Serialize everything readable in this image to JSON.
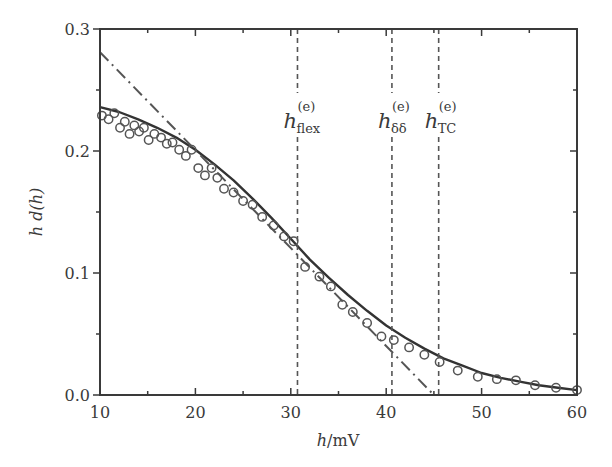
{
  "chart_data": {
    "type": "scatter",
    "title": "",
    "xlabel": "h/mV",
    "ylabel": "h d(h)",
    "xlim": [
      10,
      60
    ],
    "ylim": [
      0.0,
      0.3
    ],
    "x_ticks": [
      10,
      20,
      30,
      40,
      50,
      60
    ],
    "x_tick_labels": [
      "10",
      "20",
      "30",
      "40",
      "50",
      "60"
    ],
    "y_ticks": [
      0.0,
      0.1,
      0.2,
      0.3
    ],
    "y_tick_labels": [
      "0.0",
      "0.1",
      "0.2",
      "0.3"
    ],
    "x_minor_step": 5,
    "y_minor_step": 0.05,
    "grid": false,
    "legend": null,
    "series": [
      {
        "name": "data (circles)",
        "kind": "scatter",
        "marker": "open-circle",
        "color": "#555555",
        "x": [
          10.2,
          10.9,
          11.5,
          12.1,
          12.6,
          13.1,
          13.6,
          14.1,
          14.6,
          15.1,
          15.7,
          16.4,
          17.0,
          17.6,
          18.3,
          19.0,
          19.6,
          20.3,
          21.0,
          21.7,
          22.3,
          23.0,
          24.0,
          25.0,
          26.0,
          27.0,
          28.2,
          29.3,
          30.3,
          31.5,
          33.0,
          34.2,
          35.4,
          36.5,
          38.0,
          39.5,
          40.8,
          42.4,
          44.0,
          45.6,
          47.5,
          49.6,
          51.6,
          53.6,
          55.6,
          57.8,
          60.0
        ],
        "y": [
          0.229,
          0.226,
          0.231,
          0.219,
          0.224,
          0.214,
          0.221,
          0.216,
          0.219,
          0.209,
          0.214,
          0.211,
          0.206,
          0.207,
          0.201,
          0.196,
          0.201,
          0.186,
          0.18,
          0.186,
          0.178,
          0.169,
          0.166,
          0.159,
          0.156,
          0.146,
          0.139,
          0.13,
          0.126,
          0.105,
          0.097,
          0.089,
          0.074,
          0.068,
          0.059,
          0.048,
          0.045,
          0.039,
          0.033,
          0.027,
          0.02,
          0.015,
          0.013,
          0.012,
          0.008,
          0.006,
          0.004
        ]
      },
      {
        "name": "fit (solid)",
        "kind": "line",
        "style": "solid",
        "color": "#333333",
        "x": [
          10,
          12,
          14,
          16,
          18,
          20,
          22,
          24,
          26,
          28,
          30,
          32,
          34,
          36,
          38,
          40,
          42,
          44,
          46,
          48,
          50,
          52,
          54,
          56,
          58,
          60
        ],
        "y": [
          0.236,
          0.232,
          0.226,
          0.219,
          0.211,
          0.201,
          0.189,
          0.176,
          0.161,
          0.145,
          0.128,
          0.111,
          0.096,
          0.082,
          0.069,
          0.057,
          0.047,
          0.038,
          0.03,
          0.024,
          0.018,
          0.014,
          0.011,
          0.008,
          0.006,
          0.004
        ]
      },
      {
        "name": "tangent (dash-dot)",
        "kind": "line",
        "style": "dash-dot",
        "color": "#555555",
        "x": [
          10,
          45.0
        ],
        "y": [
          0.281,
          0.0
        ]
      }
    ],
    "vertical_lines": [
      {
        "x": 30.7,
        "label_main": "h",
        "label_sup": "(e)",
        "label_sub": "flex",
        "style": "dashed"
      },
      {
        "x": 40.6,
        "label_main": "h",
        "label_sup": "(e)",
        "label_sub": "δδ",
        "style": "dashed"
      },
      {
        "x": 45.5,
        "label_main": "h",
        "label_sup": "(e)",
        "label_sub": "TC",
        "style": "dashed"
      }
    ],
    "colors": {
      "axis": "#3a3a3a",
      "fit": "#333333",
      "markers": "#555555",
      "dashed": "#555555"
    }
  }
}
